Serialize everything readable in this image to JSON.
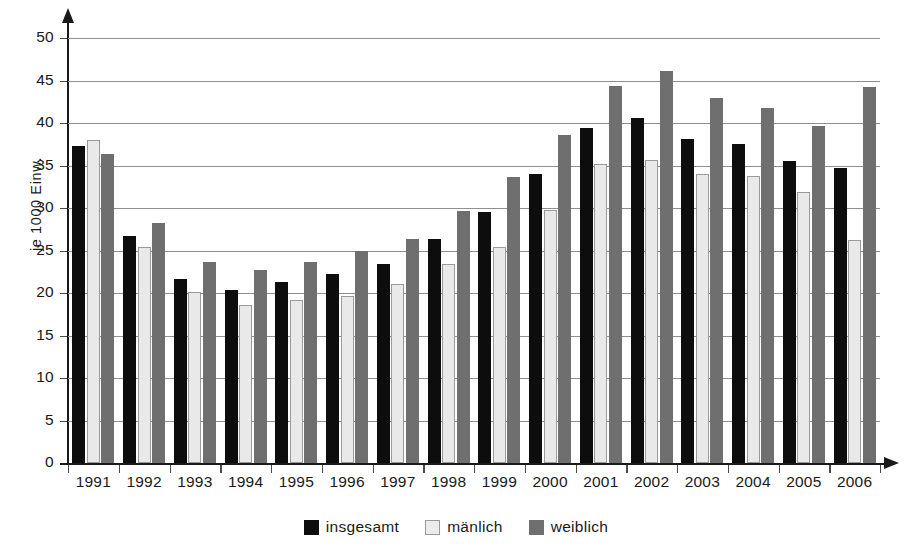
{
  "chart_data": {
    "type": "bar",
    "title": "",
    "xlabel": "",
    "ylabel": "je 1000 Einw.",
    "ylim": [
      0,
      50
    ],
    "ytick_step": 5,
    "grid": true,
    "legend_position": "bottom-center",
    "categories": [
      "1991",
      "1992",
      "1993",
      "1994",
      "1995",
      "1996",
      "1997",
      "1998",
      "1999",
      "2000",
      "2001",
      "2002",
      "2003",
      "2004",
      "2005",
      "2006"
    ],
    "series": [
      {
        "name": "insgesamt",
        "color": "#0d0d0d",
        "values": [
          37.3,
          26.7,
          21.6,
          20.4,
          21.3,
          22.2,
          23.4,
          26.4,
          29.5,
          34.0,
          39.4,
          40.6,
          38.1,
          37.5,
          35.5,
          34.7
        ]
      },
      {
        "name": "mänlich",
        "color": "#e9e9e9",
        "values": [
          38.0,
          25.4,
          20.1,
          18.6,
          19.2,
          19.6,
          21.1,
          23.4,
          25.4,
          29.8,
          35.2,
          35.6,
          34.0,
          33.8,
          31.9,
          26.2
        ]
      },
      {
        "name": "weiblich",
        "color": "#6f6f6f",
        "values": [
          36.4,
          28.2,
          23.7,
          22.7,
          23.6,
          24.9,
          26.3,
          29.7,
          33.7,
          38.6,
          44.4,
          46.1,
          42.9,
          41.8,
          39.6,
          44.2
        ]
      }
    ],
    "ytick_labels": [
      "0",
      "5",
      "10",
      "15",
      "20",
      "25",
      "30",
      "35",
      "40",
      "45",
      "50"
    ],
    "ytick_values": [
      0,
      5,
      10,
      15,
      20,
      25,
      30,
      35,
      40,
      45,
      50
    ]
  },
  "legend": {
    "items": [
      {
        "label": "insgesamt",
        "key": "total"
      },
      {
        "label": "mänlich",
        "key": "male"
      },
      {
        "label": "weiblich",
        "key": "female"
      }
    ]
  },
  "axis": {
    "y_title": "je 1000 Einw."
  }
}
